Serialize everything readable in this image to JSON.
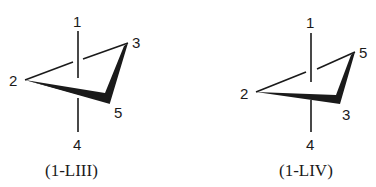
{
  "figures": [
    {
      "caption": "(1-LIII)",
      "labels": {
        "top": "1",
        "left": "2",
        "upper_right": "3",
        "lower_right": "5",
        "bottom": "4"
      }
    },
    {
      "caption": "(1-LIV)",
      "labels": {
        "top": "1",
        "left": "2",
        "upper_right": "5",
        "lower_right": "3",
        "bottom": "4"
      }
    }
  ],
  "colors": {
    "ink": "#1a1a1a",
    "background": "#ffffff"
  }
}
